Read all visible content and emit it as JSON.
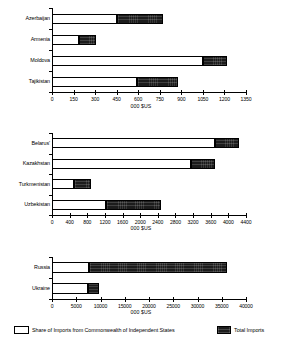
{
  "legend": {
    "share_label": "Share of Imports from Commonwealth of Independent States",
    "total_label": "Total Imports",
    "share_color": "#ffffff",
    "total_color": "#1c1c1c"
  },
  "axis_title": "000 $US",
  "chart_data": [
    {
      "type": "bar",
      "orientation": "horizontal",
      "title": "",
      "xlabel": "000 $US",
      "ylabel": "",
      "categories": [
        "Azerbaijan",
        "Armenia",
        "Moldova",
        "Tajikistan"
      ],
      "series": [
        {
          "name": "Share of Imports from Commonwealth of Independent States",
          "values": [
            450,
            190,
            1050,
            590
          ]
        },
        {
          "name": "Total Imports",
          "values": [
            770,
            305,
            1215,
            880
          ]
        }
      ],
      "xlim": [
        0,
        1350
      ],
      "xticks": [
        0,
        150,
        300,
        450,
        600,
        750,
        900,
        1050,
        1200,
        1350
      ],
      "xticklabels": [
        "0",
        "150",
        "300",
        "450",
        "600",
        "750",
        "900",
        "1050",
        "1200",
        "1350"
      ],
      "grid": false,
      "legend_position": "bottom"
    },
    {
      "type": "bar",
      "orientation": "horizontal",
      "title": "",
      "xlabel": "000 $US",
      "ylabel": "",
      "categories": [
        "Belarus'",
        "Kazakhstan",
        "Turkmenistan",
        "Uzbekistan"
      ],
      "series": [
        {
          "name": "Share of Imports from Commonwealth of Independent States",
          "values": [
            3700,
            3150,
            500,
            1230
          ]
        },
        {
          "name": "Total Imports",
          "values": [
            4250,
            3700,
            880,
            2480
          ]
        }
      ],
      "xlim": [
        0,
        4400
      ],
      "xticks": [
        0,
        400,
        800,
        1200,
        1600,
        2000,
        2400,
        2800,
        3200,
        3600,
        4000,
        4400
      ],
      "xticklabels": [
        "0",
        "400",
        "800",
        "1200",
        "1600",
        "2000",
        "2400",
        "2800",
        "3200",
        "3600",
        "4000",
        "4400"
      ],
      "grid": false,
      "legend_position": "bottom"
    },
    {
      "type": "bar",
      "orientation": "horizontal",
      "title": "",
      "xlabel": "000 $US",
      "ylabel": "",
      "categories": [
        "Russia",
        "Ukraine"
      ],
      "series": [
        {
          "name": "Share of Imports from Commonwealth of Independent States",
          "values": [
            7700,
            7500
          ]
        },
        {
          "name": "Total Imports",
          "values": [
            36000,
            9700
          ]
        }
      ],
      "xlim": [
        0,
        40000
      ],
      "xticks": [
        0,
        5000,
        10000,
        15000,
        20000,
        25000,
        30000,
        35000,
        40000
      ],
      "xticklabels": [
        "0",
        "5000",
        "10000",
        "15000",
        "20000",
        "25000",
        "30000",
        "35000",
        "40000"
      ],
      "grid": false,
      "legend_position": "bottom"
    }
  ]
}
